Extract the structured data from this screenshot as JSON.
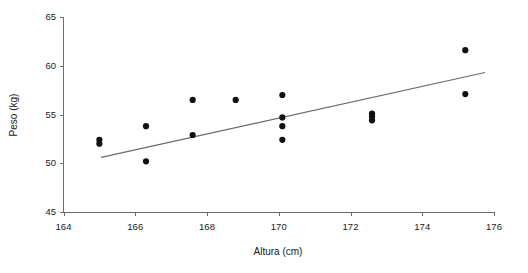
{
  "chart_data": {
    "type": "scatter",
    "title": "",
    "xlabel": "Altura (cm)",
    "ylabel": "Peso (kg)",
    "xlim": [
      164,
      176
    ],
    "ylim": [
      45,
      65
    ],
    "xticks": [
      164,
      166,
      168,
      170,
      172,
      174,
      176
    ],
    "yticks": [
      45,
      50,
      55,
      60,
      65
    ],
    "grid": false,
    "legend": null,
    "series": [
      {
        "name": "observations",
        "marker": "filled-circle",
        "color": "#111111",
        "points": [
          {
            "x": 165.0,
            "y": 52.4
          },
          {
            "x": 165.0,
            "y": 52.0
          },
          {
            "x": 166.3,
            "y": 53.8
          },
          {
            "x": 166.3,
            "y": 50.2
          },
          {
            "x": 167.6,
            "y": 56.5
          },
          {
            "x": 167.6,
            "y": 52.9
          },
          {
            "x": 168.8,
            "y": 56.5
          },
          {
            "x": 170.1,
            "y": 57.0
          },
          {
            "x": 170.1,
            "y": 54.7
          },
          {
            "x": 170.1,
            "y": 53.8
          },
          {
            "x": 170.1,
            "y": 52.4
          },
          {
            "x": 172.6,
            "y": 55.1
          },
          {
            "x": 172.6,
            "y": 54.8
          },
          {
            "x": 172.6,
            "y": 54.4
          },
          {
            "x": 175.2,
            "y": 61.6
          },
          {
            "x": 175.2,
            "y": 57.1
          }
        ]
      },
      {
        "name": "regression-line",
        "type": "line",
        "color": "#6a6a6a",
        "x_start": 165.05,
        "y_start": 50.6,
        "x_end": 175.75,
        "y_end": 59.3
      }
    ]
  },
  "axes": {
    "x_tick_labels": [
      "164",
      "166",
      "168",
      "170",
      "172",
      "174",
      "176"
    ],
    "y_tick_labels": [
      "45",
      "50",
      "55",
      "60",
      "65"
    ],
    "x_title": "Altura (cm)",
    "y_title": "Peso (kg)"
  }
}
